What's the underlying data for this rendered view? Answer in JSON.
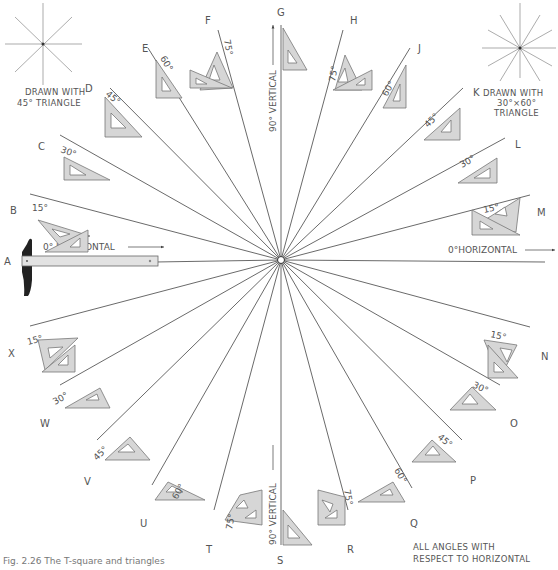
{
  "figure": {
    "caption": "Fig. 2.26  The T-square and triangles",
    "center": [
      281,
      260
    ],
    "notes": {
      "left_star": [
        "DRAWN WITH",
        "45° TRIANGLE"
      ],
      "right_star": [
        "DRAWN WITH",
        "30°×60°",
        "TRIANGLE"
      ],
      "bottom_right": [
        "ALL ANGLES WITH",
        "RESPECT TO HORIZONTAL"
      ]
    },
    "horizontal_label_left": "0° HORIZONTAL",
    "horizontal_label_right": "0°HORIZONTAL",
    "vertical_label_top": "90° VERTICAL",
    "vertical_label_bottom": "90° VERTICAL",
    "lines": [
      {
        "letter": "A",
        "angle_label": "0°",
        "direction_deg": 180
      },
      {
        "letter": "B",
        "angle_label": "15°",
        "direction_deg": 165
      },
      {
        "letter": "C",
        "angle_label": "30°",
        "direction_deg": 150
      },
      {
        "letter": "D",
        "angle_label": "45°",
        "direction_deg": 135
      },
      {
        "letter": "E",
        "angle_label": "60°",
        "direction_deg": 120
      },
      {
        "letter": "F",
        "angle_label": "75°",
        "direction_deg": 105
      },
      {
        "letter": "G",
        "angle_label": "90°",
        "direction_deg": 90
      },
      {
        "letter": "H",
        "angle_label": "75°",
        "direction_deg": 75
      },
      {
        "letter": "J",
        "angle_label": "60°",
        "direction_deg": 60
      },
      {
        "letter": "K",
        "angle_label": "45°",
        "direction_deg": 45
      },
      {
        "letter": "L",
        "angle_label": "30°",
        "direction_deg": 30
      },
      {
        "letter": "M",
        "angle_label": "15°",
        "direction_deg": 15
      },
      {
        "letter": "N",
        "angle_label": "15°",
        "direction_deg": -15
      },
      {
        "letter": "O",
        "angle_label": "30°",
        "direction_deg": -30
      },
      {
        "letter": "P",
        "angle_label": "45°",
        "direction_deg": -45
      },
      {
        "letter": "Q",
        "angle_label": "60°",
        "direction_deg": -60
      },
      {
        "letter": "R",
        "angle_label": "75°",
        "direction_deg": -75
      },
      {
        "letter": "S",
        "angle_label": "90°",
        "direction_deg": -90
      },
      {
        "letter": "T",
        "angle_label": "75°",
        "direction_deg": -105
      },
      {
        "letter": "U",
        "angle_label": "60°",
        "direction_deg": -120
      },
      {
        "letter": "V",
        "angle_label": "45°",
        "direction_deg": -135
      },
      {
        "letter": "W",
        "angle_label": "30°",
        "direction_deg": -150
      },
      {
        "letter": "X",
        "angle_label": "15°",
        "direction_deg": -165
      }
    ],
    "letters": {
      "A": "A",
      "B": "B",
      "C": "C",
      "D": "D",
      "E": "E",
      "F": "F",
      "G": "G",
      "H": "H",
      "J": "J",
      "K": "K",
      "L": "L",
      "M": "M",
      "N": "N",
      "O": "O",
      "P": "P",
      "Q": "Q",
      "R": "R",
      "S": "S",
      "T": "T",
      "U": "U",
      "V": "V",
      "W": "W",
      "X": "X"
    },
    "angles": {
      "15": "15°",
      "30": "30°",
      "45": "45°",
      "60": "60°",
      "75": "75°"
    }
  }
}
